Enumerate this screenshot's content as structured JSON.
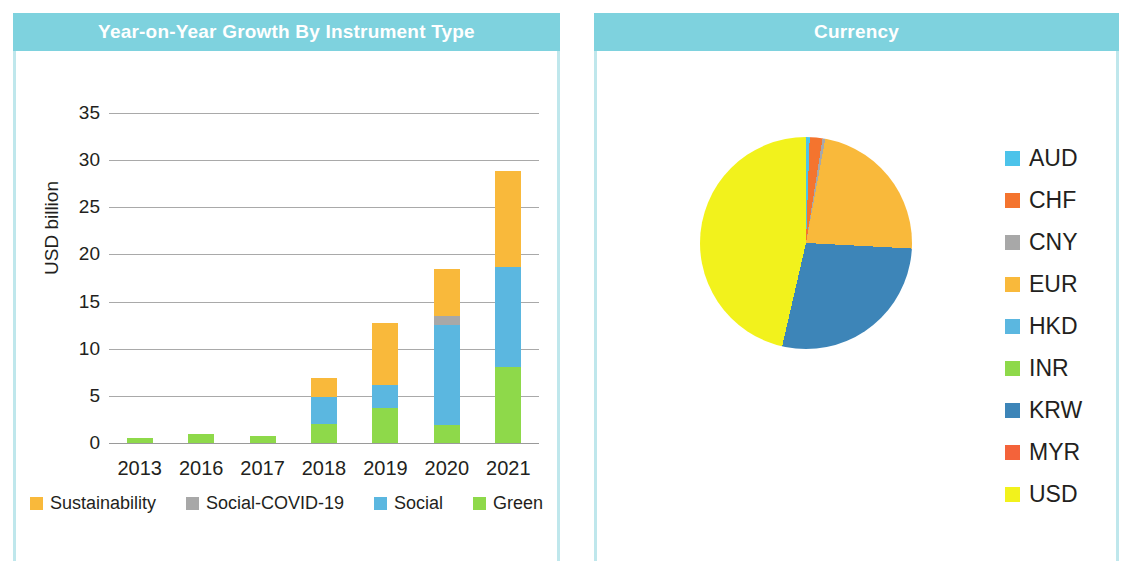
{
  "panels": {
    "left": {
      "title": "Year-on-Year Growth By Instrument Type"
    },
    "right": {
      "title": "Currency"
    }
  },
  "theme": {
    "header_bg": "#7ed2de",
    "header_text": "#ffffff",
    "panel_border": "#bfe7ec",
    "text": "#231f20",
    "gridline": "#9a9a9a"
  },
  "chart_data": [
    {
      "type": "bar",
      "title": "Year-on-Year Growth By Instrument Type",
      "stacked": true,
      "xlabel": "",
      "ylabel": "USD billion",
      "ylim": [
        0,
        35
      ],
      "yticks": [
        0,
        5,
        10,
        15,
        20,
        25,
        30,
        35
      ],
      "grid": true,
      "legend_position": "bottom",
      "categories": [
        "2013",
        "2016",
        "2017",
        "2018",
        "2019",
        "2020",
        "2021"
      ],
      "series": [
        {
          "name": "Green",
          "color": "#8ed94a",
          "values": [
            0.5,
            1.0,
            0.7,
            2.0,
            3.7,
            1.9,
            8.1
          ]
        },
        {
          "name": "Social",
          "color": "#5bb7e0",
          "values": [
            0,
            0,
            0,
            2.9,
            2.5,
            10.6,
            10.6
          ]
        },
        {
          "name": "Social-COVID-19",
          "color": "#a8a8a8",
          "values": [
            0,
            0,
            0,
            0,
            0,
            1.0,
            0
          ]
        },
        {
          "name": "Sustainability",
          "color": "#f9b93b",
          "values": [
            0,
            0,
            0,
            2.0,
            6.5,
            5.0,
            10.1
          ]
        }
      ],
      "totals": [
        0.5,
        1.0,
        0.7,
        6.9,
        12.7,
        18.5,
        28.8
      ],
      "legend_order": [
        "Sustainability",
        "Social-COVID-19",
        "Social",
        "Green"
      ]
    },
    {
      "type": "pie",
      "title": "Currency",
      "legend_position": "right",
      "start_angle_deg": 0,
      "direction": "clockwise",
      "labels": [
        "AUD",
        "CHF",
        "CNY",
        "EUR",
        "HKD",
        "INR",
        "KRW",
        "MYR",
        "USD"
      ],
      "colors": [
        "#4cc3ea",
        "#f4742e",
        "#a8a8a8",
        "#f9b93b",
        "#5bb7e0",
        "#8ed94a",
        "#3d85b8",
        "#f4633a",
        "#f2f21c"
      ],
      "angles_deg": [
        2.0,
        7.0,
        1.5,
        82.5,
        0.0,
        0.0,
        100.0,
        0.0,
        167.0
      ],
      "percent": [
        0.6,
        1.9,
        0.4,
        22.9,
        0.0,
        0.0,
        27.8,
        0.0,
        46.4
      ],
      "slice_order": [
        "AUD",
        "CHF",
        "CNY",
        "EUR",
        "KRW",
        "USD"
      ]
    }
  ]
}
